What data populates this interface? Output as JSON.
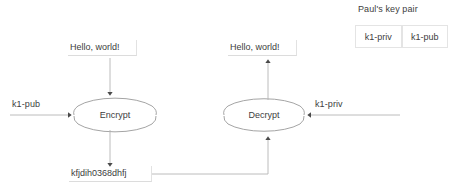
{
  "diagram": {
    "title_hidden": "",
    "nodes": [
      {
        "id": "encrypt",
        "label": "Encrypt",
        "shape": "ellipse"
      },
      {
        "id": "decrypt",
        "label": "Decrypt",
        "shape": "ellipse"
      }
    ],
    "labels": {
      "plaintext_left": "Hello, world!",
      "plaintext_right": "Hello, world!",
      "ciphertext": "kfjdih0368dhfj",
      "key_in_left": "k1-pub",
      "key_in_right": "k1-priv"
    },
    "keypair": {
      "title": "Paul's key pair",
      "cells": [
        {
          "label": "k1-priv"
        },
        {
          "label": "k1-pub"
        }
      ]
    },
    "colors": {
      "stroke": "#9a9a9a",
      "text": "#3d3d3d",
      "arrowhead": "#4a4a4a",
      "cell_border": "#e4e4e4",
      "background": "#ffffff"
    }
  }
}
